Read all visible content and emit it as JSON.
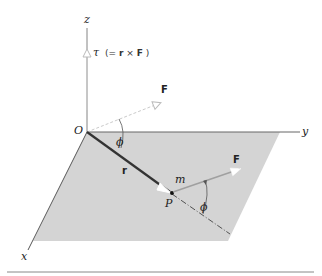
{
  "figure": {
    "colors": {
      "plane_fill": "#d4d4d4",
      "axis_line": "#666666",
      "vector_r": "#333333",
      "vector_F": "#aaaaaa",
      "vector_tau": "#bbbbbb",
      "divider": "#888888"
    }
  },
  "labels": {
    "axis_z": "z",
    "axis_y": "y",
    "axis_x": "x",
    "origin": "O",
    "torque_symbol": "τ",
    "torque_eq_open": "(= ",
    "torque_r": "r",
    "torque_times": " × ",
    "torque_F": "F",
    "torque_eq_close": ")",
    "force_at_origin": "F",
    "force_at_P": "F",
    "position_vector": "r",
    "angle_at_origin": "ϕ",
    "angle_at_P": "ϕ",
    "mass": "m",
    "point": "P"
  }
}
